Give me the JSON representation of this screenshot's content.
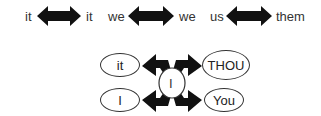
{
  "top_row": {
    "pairs": [
      {
        "left": "it",
        "right": "it"
      },
      {
        "left": "we",
        "right": "we"
      },
      {
        "left": "us",
        "right": "them"
      }
    ]
  },
  "bottom_diagram": {
    "center": "I",
    "top_left": "it",
    "top_right": "THOU",
    "bottom_left": "I",
    "bottom_right": "You"
  },
  "colors": {
    "arrow": "#111111",
    "text": "#333333"
  }
}
